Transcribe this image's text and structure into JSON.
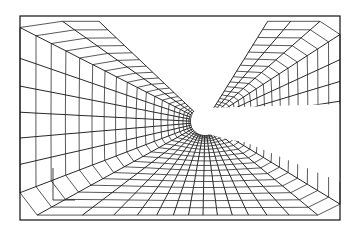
{
  "figure": {
    "type": "perspective curvilinear mesh around elongated body",
    "frame": {
      "x1": 20,
      "y1": 16,
      "x2": 340,
      "y2": 220
    },
    "body_opening": {
      "cx": 205,
      "cy": 122,
      "rx": 14,
      "ry": 14
    },
    "body_end_x": 300,
    "stroke_color": "#111111",
    "background": "#ffffff",
    "scale_marker": {
      "label": "",
      "x": 53,
      "y": 178
    }
  }
}
